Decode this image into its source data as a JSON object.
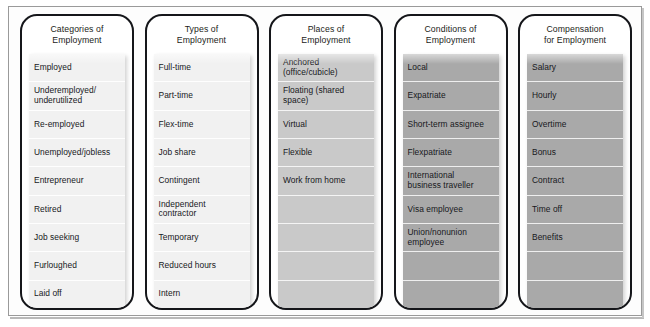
{
  "figure": {
    "accent_border_color": "#15161a",
    "frame_color": "#9a9a9a",
    "shades": {
      "light": "#f1f1f1",
      "mid": "#c9c9c9",
      "dark": "#a9a9a9"
    }
  },
  "columns": [
    {
      "id": "categories-of-employment",
      "title": "Categories of\nEmployment",
      "shade": "light",
      "items": [
        "Employed",
        "Underemployed/\nunderutilized",
        "Re-employed",
        "Unemployed/jobless",
        "Entrepreneur",
        "Retired",
        "Job seeking",
        "Furloughed",
        "Laid off"
      ]
    },
    {
      "id": "types-of-employment",
      "title": "Types of\nEmployment",
      "shade": "light",
      "items": [
        "Full-time",
        "Part-time",
        "Flex-time",
        "Job share",
        "Contingent",
        "Independent\ncontractor",
        "Temporary",
        "Reduced hours",
        "Intern"
      ]
    },
    {
      "id": "places-of-employment",
      "title": "Places of\nEmployment",
      "shade": "mid",
      "items": [
        "Anchored\n(office/cubicle)",
        "Floating (shared\nspace)",
        "Virtual",
        "Flexible",
        "Work from home",
        "",
        "",
        "",
        ""
      ]
    },
    {
      "id": "conditions-of-employment",
      "title": "Conditions of\nEmployment",
      "shade": "dark",
      "items": [
        "Local",
        "Expatriate",
        "Short-term assignee",
        "Flexpatriate",
        "International\nbusiness traveller",
        "Visa employee",
        "Union/nonunion\nemployee",
        "",
        ""
      ]
    },
    {
      "id": "compensation-for-employment",
      "title": "Compensation\nfor Employment",
      "shade": "dark",
      "items": [
        "Salary",
        "Hourly",
        "Overtime",
        "Bonus",
        "Contract",
        "Time off",
        "Benefits",
        "",
        ""
      ]
    }
  ]
}
